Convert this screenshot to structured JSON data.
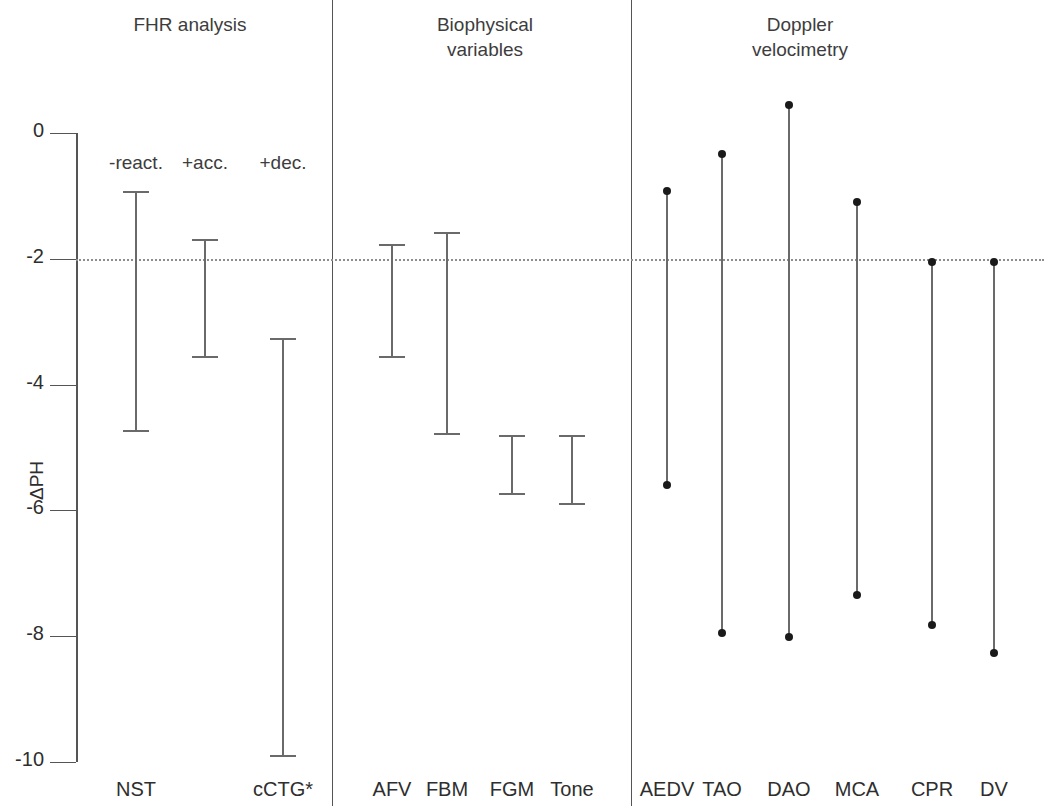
{
  "figure": {
    "y_axis_label": "ΔPH",
    "y_ticks": [
      "0",
      "-2",
      "-4",
      "-6",
      "-8",
      "-10"
    ],
    "y_tick_values": [
      0,
      -2,
      -4,
      -6,
      -8,
      -10
    ],
    "reference_line_value": -2
  },
  "sections": [
    {
      "id": "fhr",
      "title": "FHR analysis"
    },
    {
      "id": "biophys",
      "title": "Biophysical\nvariables"
    },
    {
      "id": "doppler",
      "title": "Doppler\nvelocimetry"
    }
  ],
  "group_labels": [
    {
      "text": "-react.",
      "x": 136
    },
    {
      "text": "+acc.",
      "x": 205
    },
    {
      "text": "+dec.",
      "x": 283
    }
  ],
  "chart_data": {
    "type": "bar",
    "title": "",
    "subtitle": "",
    "xlabel": "",
    "ylabel": "ΔPH",
    "ylim": [
      -10.4,
      0.9
    ],
    "grid": false,
    "legend": "none",
    "reference_line": -2,
    "annotations": [
      "-react.",
      "+acc.",
      "+dec."
    ],
    "sections": [
      "FHR analysis",
      "Biophysical variables",
      "Doppler velocimetry"
    ],
    "categories": [
      "NST",
      "cCTG*",
      "AFV",
      "FBM",
      "FGM",
      "Tone",
      "AEDV",
      "TAO",
      "DAO",
      "MCA",
      "CPR",
      "DV"
    ],
    "series": [
      {
        "name": "upper limit",
        "values": [
          -0.92,
          -3.26,
          -1.77,
          -1.57,
          -4.8,
          -4.8,
          -0.92,
          -0.33,
          0.45,
          -1.1,
          -2.05,
          -2.05
        ]
      },
      {
        "name": "lower limit",
        "values": [
          -4.75,
          -9.92,
          -3.57,
          -4.8,
          -5.75,
          -5.92,
          -5.6,
          -7.95,
          -8.02,
          -7.35,
          -7.82,
          -8.27
        ]
      }
    ],
    "bars": [
      {
        "label": "NST",
        "section": "FHR analysis",
        "group": "-react.",
        "high": -0.92,
        "low": -4.75,
        "marker": "caps",
        "x": 136
      },
      {
        "label": "",
        "section": "FHR analysis",
        "group": "+acc.",
        "high": -1.69,
        "low": -3.57,
        "marker": "caps",
        "x": 205
      },
      {
        "label": "cCTG*",
        "section": "FHR analysis",
        "group": "+dec.",
        "high": -3.26,
        "low": -9.92,
        "marker": "caps",
        "x": 283
      },
      {
        "label": "AFV",
        "section": "Biophysical variables",
        "group": "",
        "high": -1.77,
        "low": -3.57,
        "marker": "caps",
        "x": 392
      },
      {
        "label": "FBM",
        "section": "Biophysical variables",
        "group": "",
        "high": -1.57,
        "low": -4.8,
        "marker": "caps",
        "x": 447
      },
      {
        "label": "FGM",
        "section": "Biophysical variables",
        "group": "",
        "high": -4.8,
        "low": -5.75,
        "marker": "caps",
        "x": 512
      },
      {
        "label": "Tone",
        "section": "Biophysical variables",
        "group": "",
        "high": -4.8,
        "low": -5.92,
        "marker": "caps",
        "x": 572
      },
      {
        "label": "AEDV",
        "section": "Doppler velocimetry",
        "group": "",
        "high": -0.92,
        "low": -5.6,
        "marker": "dots",
        "x": 667
      },
      {
        "label": "TAO",
        "section": "Doppler velocimetry",
        "group": "",
        "high": -0.33,
        "low": -7.95,
        "marker": "dots",
        "x": 722
      },
      {
        "label": "DAO",
        "section": "Doppler velocimetry",
        "group": "",
        "high": 0.45,
        "low": -8.02,
        "marker": "dots",
        "x": 789
      },
      {
        "label": "MCA",
        "section": "Doppler velocimetry",
        "group": "",
        "high": -1.1,
        "low": -7.35,
        "marker": "dots",
        "x": 857
      },
      {
        "label": "CPR",
        "section": "Doppler velocimetry",
        "group": "",
        "high": -2.05,
        "low": -7.82,
        "marker": "dots",
        "x": 932
      },
      {
        "label": "DV",
        "section": "Doppler velocimetry",
        "group": "",
        "high": -2.05,
        "low": -8.27,
        "marker": "dots",
        "x": 994
      }
    ],
    "x_tick_labels": [
      {
        "text": "NST",
        "x": 136
      },
      {
        "text": "cCTG*",
        "x": 283
      },
      {
        "text": "AFV",
        "x": 392
      },
      {
        "text": "FBM",
        "x": 447
      },
      {
        "text": "FGM",
        "x": 512
      },
      {
        "text": "Tone",
        "x": 572
      },
      {
        "text": "AEDV",
        "x": 667
      },
      {
        "text": "TAO",
        "x": 722
      },
      {
        "text": "DAO",
        "x": 789
      },
      {
        "text": "MCA",
        "x": 857
      },
      {
        "text": "CPR",
        "x": 932
      },
      {
        "text": "DV",
        "x": 994
      }
    ]
  },
  "layout": {
    "section_head_positions": [
      {
        "left": 60,
        "width": 260,
        "top": 12
      },
      {
        "left": 350,
        "width": 270,
        "top": 12
      },
      {
        "left": 650,
        "width": 300,
        "top": 12
      }
    ],
    "dividers": [
      {
        "x": 332,
        "top": 0,
        "height": 806
      },
      {
        "x": 631,
        "top": 0,
        "height": 806
      }
    ],
    "axis_x": 76,
    "axis_top": 133,
    "axis_bottom": 762,
    "px_per_unit": 62.9,
    "refline_left": 76,
    "refline_right": 1044,
    "xtick_label_y": 778
  },
  "colors": {
    "background": "#ffffff",
    "axis": "#555555",
    "bar": "#6a6a6a",
    "dot": "#1a1a1a",
    "refline": "#8d8d8d",
    "text": "#2e2e2e"
  }
}
